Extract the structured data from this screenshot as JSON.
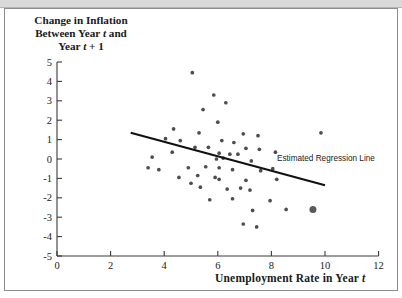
{
  "figure": {
    "title_line1": "Change in Inflation",
    "title_line2_a": "Between Year ",
    "title_line2_t": "t",
    "title_line2_b": " and",
    "title_line3_a": "Year ",
    "title_line3_t": "t",
    "title_line3_b": " + 1",
    "xlabel_a": "Unemployment Rate in Year ",
    "xlabel_t": "t",
    "regression_label": "Estimated Regression Line"
  },
  "colors": {
    "point": "#4d4d4d",
    "highlight_point": "#595959",
    "line": "#111111",
    "axis": "#3a3a3a",
    "frame": "#8c8c8c",
    "topbar": "#d9d9d9",
    "background": "#ffffff"
  },
  "chart_data": {
    "type": "scatter",
    "title": "Change in Inflation Between Year t and Year t + 1",
    "xlabel": "Unemployment Rate in Year t",
    "ylabel": "Change in Inflation Between Year t and Year t + 1",
    "xlim": [
      0,
      12
    ],
    "ylim": [
      -5,
      5
    ],
    "xticks": [
      0,
      2,
      4,
      6,
      8,
      10,
      12
    ],
    "yticks": [
      -5,
      -4,
      -3,
      -2,
      -1,
      0,
      1,
      2,
      3,
      4,
      5
    ],
    "grid": false,
    "legend": "none",
    "points": [
      {
        "x": 5.05,
        "y": 4.45
      },
      {
        "x": 5.85,
        "y": 3.3
      },
      {
        "x": 6.3,
        "y": 2.9
      },
      {
        "x": 5.45,
        "y": 2.55
      },
      {
        "x": 6.0,
        "y": 1.9
      },
      {
        "x": 4.35,
        "y": 1.55
      },
      {
        "x": 5.3,
        "y": 1.35
      },
      {
        "x": 6.95,
        "y": 1.3
      },
      {
        "x": 7.5,
        "y": 1.2
      },
      {
        "x": 9.85,
        "y": 1.35
      },
      {
        "x": 4.05,
        "y": 1.05
      },
      {
        "x": 4.6,
        "y": 0.95
      },
      {
        "x": 6.15,
        "y": 0.95
      },
      {
        "x": 6.6,
        "y": 0.85
      },
      {
        "x": 5.15,
        "y": 0.6
      },
      {
        "x": 5.65,
        "y": 0.6
      },
      {
        "x": 7.05,
        "y": 0.55
      },
      {
        "x": 7.55,
        "y": 0.5
      },
      {
        "x": 4.3,
        "y": 0.35
      },
      {
        "x": 6.05,
        "y": 0.3
      },
      {
        "x": 6.45,
        "y": 0.25
      },
      {
        "x": 6.75,
        "y": 0.25
      },
      {
        "x": 8.15,
        "y": 0.35
      },
      {
        "x": 3.55,
        "y": 0.1
      },
      {
        "x": 5.95,
        "y": 0.0
      },
      {
        "x": 6.2,
        "y": 0.05
      },
      {
        "x": 7.25,
        "y": -0.1
      },
      {
        "x": 3.4,
        "y": -0.45
      },
      {
        "x": 3.8,
        "y": -0.55
      },
      {
        "x": 4.9,
        "y": -0.45
      },
      {
        "x": 5.55,
        "y": -0.4
      },
      {
        "x": 6.05,
        "y": -0.45
      },
      {
        "x": 6.55,
        "y": -0.55
      },
      {
        "x": 7.6,
        "y": -0.6
      },
      {
        "x": 8.05,
        "y": -0.5
      },
      {
        "x": 4.55,
        "y": -0.95
      },
      {
        "x": 5.25,
        "y": -0.85
      },
      {
        "x": 5.9,
        "y": -0.95
      },
      {
        "x": 6.05,
        "y": -1.05
      },
      {
        "x": 7.05,
        "y": -1.1
      },
      {
        "x": 8.2,
        "y": -1.05
      },
      {
        "x": 5.0,
        "y": -1.25
      },
      {
        "x": 5.35,
        "y": -1.45
      },
      {
        "x": 6.35,
        "y": -1.55
      },
      {
        "x": 6.85,
        "y": -1.5
      },
      {
        "x": 7.2,
        "y": -1.6
      },
      {
        "x": 5.7,
        "y": -2.1
      },
      {
        "x": 6.55,
        "y": -2.05
      },
      {
        "x": 7.95,
        "y": -2.15
      },
      {
        "x": 7.3,
        "y": -2.65
      },
      {
        "x": 8.55,
        "y": -2.6
      },
      {
        "x": 6.95,
        "y": -3.35
      },
      {
        "x": 7.45,
        "y": -3.5
      }
    ],
    "highlight_point": {
      "x": 9.55,
      "y": -2.6,
      "size": 7
    },
    "regression_line": {
      "x1": 2.75,
      "y1": 1.35,
      "x2": 10.0,
      "y2": -1.35,
      "label": "Estimated Regression Line"
    }
  }
}
